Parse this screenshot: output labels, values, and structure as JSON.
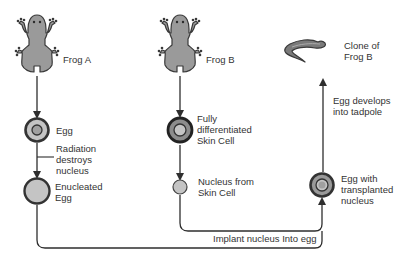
{
  "colors": {
    "line": "#2e2e2e",
    "frog_fill": "#9a9a9a",
    "frog_stroke": "#3a3a3a",
    "cell_ring": "#3a3a3a",
    "cytoplasm": "#c4c4c4",
    "nucleus": "#a0a0a0",
    "skin_cytoplasm": "#8c8c8c",
    "tadpole": "#7a7a7a"
  },
  "frog_a": {
    "label": "Frog A"
  },
  "frog_b": {
    "label": "Frog B"
  },
  "egg": {
    "label": "Egg"
  },
  "radiation": {
    "lines": [
      "Radiation",
      "destroys",
      "nucleus"
    ]
  },
  "enucleated_egg": {
    "lines": [
      "Enucleated",
      "Egg"
    ]
  },
  "skin_cell": {
    "lines": [
      "Fully",
      "differentiated",
      "Skin Cell"
    ]
  },
  "nucleus_from_skin": {
    "lines": [
      "Nucleus from",
      "Skin Cell"
    ]
  },
  "egg_with_nucleus": {
    "lines": [
      "Egg with",
      "transplanted",
      "nucleus"
    ]
  },
  "egg_develops": {
    "lines": [
      "Egg develops",
      "into tadpole"
    ]
  },
  "clone": {
    "lines": [
      "Clone of",
      "Frog B"
    ]
  },
  "implant": {
    "label": "Implant nucleus Into egg"
  }
}
